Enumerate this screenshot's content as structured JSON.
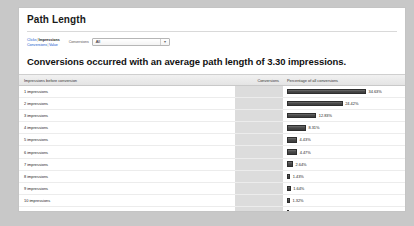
{
  "panel": {
    "title": "Path Length"
  },
  "controls": {
    "metric_links": {
      "line1": [
        "Clicks",
        "Impressions"
      ],
      "line2": [
        "Conversions",
        "Value"
      ],
      "selected": "Impressions",
      "separator": "|"
    },
    "conversion_filter": {
      "label": "Conversions",
      "value": "All",
      "options": [
        "All"
      ],
      "arrow_icon": "chevron-down-icon"
    }
  },
  "headline": "Conversions occurred with an average path length of 3.30 impressions.",
  "table": {
    "columns": [
      "Impressions before conversion",
      "Conversions",
      "Percentage of all conversions"
    ],
    "rows": [
      {
        "label": "1 impressions",
        "conversions": "",
        "percentage": "34.63%"
      },
      {
        "label": "2 impressions",
        "conversions": "",
        "percentage": "24.42%"
      },
      {
        "label": "3 impressions",
        "conversions": "",
        "percentage": "12.83%"
      },
      {
        "label": "4 impressions",
        "conversions": "",
        "percentage": "8.31%"
      },
      {
        "label": "5 impressions",
        "conversions": "",
        "percentage": "4.43%"
      },
      {
        "label": "6 impressions",
        "conversions": "",
        "percentage": "4.47%"
      },
      {
        "label": "7 impressions",
        "conversions": "",
        "percentage": "2.64%"
      },
      {
        "label": "8 impressions",
        "conversions": "",
        "percentage": "1.43%"
      },
      {
        "label": "9 impressions",
        "conversions": "",
        "percentage": "1.64%"
      },
      {
        "label": "10 impressions",
        "conversions": "",
        "percentage": "1.32%"
      },
      {
        "label": "11 impressions",
        "conversions": "",
        "percentage": "0.85%"
      },
      {
        "label": "12+ impressions",
        "conversions": "",
        "percentage": "2.96%"
      }
    ]
  },
  "colors": {
    "bar": "#3c3c3c",
    "page_background": "#c8c8c8",
    "panel_background": "#ffffff",
    "conversions_column": "#dcdcdc",
    "link": "#1155cc"
  },
  "chart_data": {
    "type": "bar",
    "title": "Path Length",
    "subtitle": "Conversions occurred with an average path length of 3.30 impressions.",
    "orientation": "horizontal",
    "xlabel": "Percentage of all conversions",
    "ylabel": "Impressions before conversion",
    "categories": [
      "1 impressions",
      "2 impressions",
      "3 impressions",
      "4 impressions",
      "5 impressions",
      "6 impressions",
      "7 impressions",
      "8 impressions",
      "9 impressions",
      "10 impressions",
      "11 impressions",
      "12+ impressions"
    ],
    "values": [
      34.63,
      24.42,
      12.83,
      8.31,
      4.43,
      4.47,
      2.64,
      1.43,
      1.64,
      1.32,
      0.85,
      2.96
    ],
    "value_labels": [
      "34.63%",
      "24.42%",
      "12.83%",
      "8.31%",
      "4.43%",
      "4.47%",
      "2.64%",
      "1.43%",
      "1.64%",
      "1.32%",
      "0.85%",
      "2.96%"
    ],
    "unit": "%",
    "xlim": [
      0,
      34.63
    ],
    "grid": false,
    "legend": false,
    "average_path_length": 3.3
  }
}
